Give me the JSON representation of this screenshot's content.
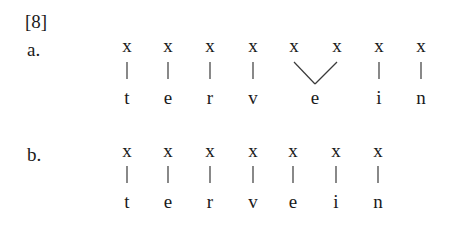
{
  "example_number": "[8]",
  "examples": [
    {
      "label": "a.",
      "skeleton": [
        "x",
        "x",
        "x",
        "x",
        "x",
        "x",
        "x",
        "x"
      ],
      "segments": [
        "t",
        "e",
        "r",
        "v",
        "e",
        "i",
        "n"
      ],
      "note": "second 'e' linked to two x-slots (long vowel)"
    },
    {
      "label": "b.",
      "skeleton": [
        "x",
        "x",
        "x",
        "x",
        "x",
        "x",
        "x"
      ],
      "segments": [
        "t",
        "e",
        "r",
        "v",
        "e",
        "i",
        "n"
      ],
      "note": "one-to-one association"
    }
  ]
}
